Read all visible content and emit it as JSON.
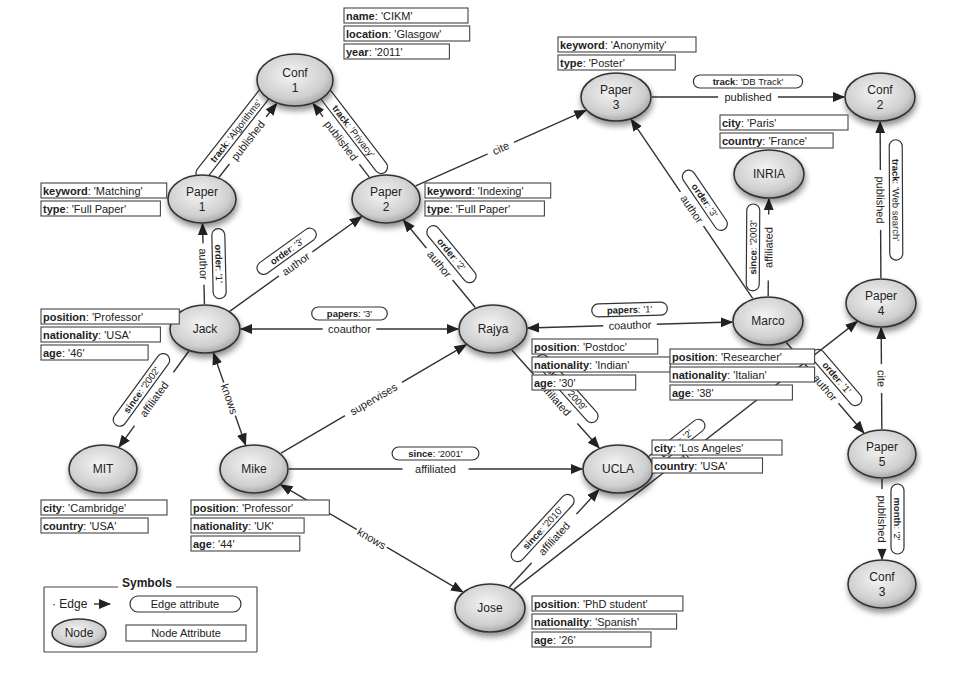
{
  "colors": {
    "node_fill_light": "#f2f2f2",
    "node_fill_dark": "#a8a8a8",
    "stroke": "#333333",
    "background": "#ffffff"
  },
  "nodes": [
    {
      "id": "conf1",
      "label": [
        "Conf",
        "1"
      ],
      "cx": 295,
      "cy": 80,
      "rx": 38,
      "ry": 26
    },
    {
      "id": "paper1",
      "label": [
        "Paper",
        "1"
      ],
      "cx": 202,
      "cy": 199,
      "rx": 34,
      "ry": 24
    },
    {
      "id": "paper2",
      "label": [
        "Paper",
        "2"
      ],
      "cx": 386,
      "cy": 199,
      "rx": 34,
      "ry": 24
    },
    {
      "id": "paper3",
      "label": [
        "Paper",
        "3"
      ],
      "cx": 616,
      "cy": 97,
      "rx": 35,
      "ry": 24
    },
    {
      "id": "conf2",
      "label": [
        "Conf",
        "2"
      ],
      "cx": 880,
      "cy": 97,
      "rx": 35,
      "ry": 24
    },
    {
      "id": "inria",
      "label": [
        "INRIA"
      ],
      "cx": 769,
      "cy": 174,
      "rx": 35,
      "ry": 24
    },
    {
      "id": "jack",
      "label": [
        "Jack"
      ],
      "cx": 205,
      "cy": 329,
      "rx": 35,
      "ry": 24
    },
    {
      "id": "rajya",
      "label": [
        "Rajya"
      ],
      "cx": 493,
      "cy": 329,
      "rx": 34,
      "ry": 24
    },
    {
      "id": "marco",
      "label": [
        "Marco"
      ],
      "cx": 768,
      "cy": 321,
      "rx": 35,
      "ry": 24
    },
    {
      "id": "paper4",
      "label": [
        "Paper",
        "4"
      ],
      "cx": 881,
      "cy": 303,
      "rx": 35,
      "ry": 24
    },
    {
      "id": "mit",
      "label": [
        "MIT"
      ],
      "cx": 103,
      "cy": 469,
      "rx": 34,
      "ry": 24
    },
    {
      "id": "mike",
      "label": [
        "Mike"
      ],
      "cx": 254,
      "cy": 469,
      "rx": 34,
      "ry": 24
    },
    {
      "id": "ucla",
      "label": [
        "UCLA"
      ],
      "cx": 618,
      "cy": 469,
      "rx": 35,
      "ry": 24
    },
    {
      "id": "paper5",
      "label": [
        "Paper",
        "5"
      ],
      "cx": 882,
      "cy": 454,
      "rx": 34,
      "ry": 24
    },
    {
      "id": "conf3",
      "label": [
        "Conf",
        "3"
      ],
      "cx": 882,
      "cy": 584,
      "rx": 34,
      "ry": 24
    },
    {
      "id": "jose",
      "label": [
        "Jose"
      ],
      "cx": 490,
      "cy": 608,
      "rx": 35,
      "ry": 24
    }
  ],
  "edges": [
    {
      "id": "e-p1-c1",
      "from": "paper1",
      "to": "conf1",
      "label": "published",
      "attr": "track: 'Algorithms'",
      "arrow": "end"
    },
    {
      "id": "e-p2-c1",
      "from": "paper2",
      "to": "conf1",
      "label": "published",
      "attr": "track: 'Privacy'",
      "arrow": "end"
    },
    {
      "id": "e-p2-p3",
      "from": "paper2",
      "to": "paper3",
      "label": "cite",
      "attr": null,
      "arrow": "end"
    },
    {
      "id": "e-p3-c2",
      "from": "paper3",
      "to": "conf2",
      "label": "published",
      "attr": "track: 'DB Track'",
      "arrow": "end"
    },
    {
      "id": "e-p4-c2",
      "from": "paper4",
      "to": "conf2",
      "label": "published",
      "attr": "track: 'Web search'",
      "arrow": "end"
    },
    {
      "id": "e-jack-p1",
      "from": "jack",
      "to": "paper1",
      "label": "author",
      "attr": "order: '1'",
      "arrow": "end"
    },
    {
      "id": "e-jack-p2",
      "from": "jack",
      "to": "paper2",
      "label": "author",
      "attr": "order: '3'",
      "arrow": "end"
    },
    {
      "id": "e-rajya-p2",
      "from": "rajya",
      "to": "paper2",
      "label": "author",
      "attr": "order: '2'",
      "arrow": "end"
    },
    {
      "id": "e-marco-p3",
      "from": "marco",
      "to": "paper3",
      "label": "author",
      "attr": "order: '3'",
      "arrow": "end"
    },
    {
      "id": "e-marco-inria",
      "from": "marco",
      "to": "inria",
      "label": "affiliated",
      "attr": "since: '2003'",
      "arrow": "end"
    },
    {
      "id": "e-jack-rajya",
      "from": "jack",
      "to": "rajya",
      "label": "coauthor",
      "attr": "papers: '3'",
      "arrow": "both"
    },
    {
      "id": "e-rajya-marco",
      "from": "rajya",
      "to": "marco",
      "label": "coauthor",
      "attr": "papers: '1'",
      "arrow": "both"
    },
    {
      "id": "e-marco-p5",
      "from": "marco",
      "to": "paper5",
      "label": "author",
      "attr": "order: '1'",
      "arrow": "end"
    },
    {
      "id": "e-jack-mit",
      "from": "jack",
      "to": "mit",
      "label": "affiliated",
      "attr": "since: '2002'",
      "arrow": "end"
    },
    {
      "id": "e-jack-mike",
      "from": "jack",
      "to": "mike",
      "label": "knows",
      "attr": null,
      "arrow": "both"
    },
    {
      "id": "e-mike-rajya",
      "from": "mike",
      "to": "rajya",
      "label": "supervises",
      "attr": null,
      "arrow": "end"
    },
    {
      "id": "e-rajya-ucla",
      "from": "rajya",
      "to": "ucla",
      "label": "affiliated",
      "attr": "since: '2009'",
      "arrow": "end"
    },
    {
      "id": "e-mike-ucla",
      "from": "mike",
      "to": "ucla",
      "label": "affiliated",
      "attr": "since: '2001'",
      "arrow": "end"
    },
    {
      "id": "e-mike-jose",
      "from": "mike",
      "to": "jose",
      "label": "knows",
      "attr": null,
      "arrow": "both"
    },
    {
      "id": "e-jose-ucla",
      "from": "jose",
      "to": "ucla",
      "label": "affiliated",
      "attr": "since: '2010'",
      "arrow": "end"
    },
    {
      "id": "e-jose-p4",
      "from": "jose",
      "to": "paper4",
      "label": "author",
      "attr": "order: '2'",
      "arrow": "end"
    },
    {
      "id": "e-p5-p4",
      "from": "paper5",
      "to": "paper4",
      "label": "cite",
      "attr": null,
      "arrow": "end"
    },
    {
      "id": "e-p5-c3",
      "from": "paper5",
      "to": "conf3",
      "label": "published",
      "attr": "month: '2'",
      "arrow": "end"
    }
  ],
  "node_attributes": [
    {
      "node": "conf1",
      "x": 344,
      "y": 8,
      "w": 124,
      "rows": [
        [
          "name",
          "'CIKM'"
        ],
        [
          "location",
          "'Glasgow'"
        ],
        [
          "year",
          "'2011'"
        ]
      ]
    },
    {
      "node": "paper1",
      "x": 41,
      "y": 183,
      "w": 124,
      "rows": [
        [
          "keyword",
          "'Matching'"
        ],
        [
          "type",
          "'Full Paper'"
        ]
      ]
    },
    {
      "node": "paper2",
      "x": 425,
      "y": 183,
      "w": 124,
      "rows": [
        [
          "keyword",
          "'Indexing'"
        ],
        [
          "type",
          "'Full Paper'"
        ]
      ]
    },
    {
      "node": "paper3",
      "x": 558,
      "y": 37,
      "w": 138,
      "rows": [
        [
          "keyword",
          "'Anonymity'"
        ],
        [
          "type",
          "'Poster'"
        ]
      ]
    },
    {
      "node": "inria",
      "x": 720,
      "y": 115,
      "w": 128,
      "rows": [
        [
          "city",
          "'Paris'"
        ],
        [
          "country",
          "'France'"
        ]
      ]
    },
    {
      "node": "jack",
      "x": 41,
      "y": 309,
      "w": 126,
      "rows": [
        [
          "position",
          "'Professor'"
        ],
        [
          "nationality",
          "'USA'"
        ],
        [
          "age",
          "'46'"
        ]
      ]
    },
    {
      "node": "rajya",
      "x": 532,
      "y": 339,
      "w": 122,
      "rows": [
        [
          "position",
          "'Postdoc'"
        ],
        [
          "nationality",
          "'Indian'"
        ],
        [
          "age",
          "'30'"
        ]
      ]
    },
    {
      "node": "marco",
      "x": 670,
      "y": 349,
      "w": 144,
      "rows": [
        [
          "position",
          "'Researcher'"
        ],
        [
          "nationality",
          "'Italian'"
        ],
        [
          "age",
          "'38'"
        ]
      ]
    },
    {
      "node": "mit",
      "x": 41,
      "y": 500,
      "w": 126,
      "rows": [
        [
          "city",
          "'Cambridge'"
        ],
        [
          "country",
          "'USA'"
        ]
      ]
    },
    {
      "node": "mike",
      "x": 191,
      "y": 500,
      "w": 128,
      "rows": [
        [
          "position",
          "'Professor'"
        ],
        [
          "nationality",
          "'UK'"
        ],
        [
          "age",
          "'44'"
        ]
      ]
    },
    {
      "node": "ucla",
      "x": 652,
      "y": 440,
      "w": 130,
      "rows": [
        [
          "city",
          "'Los Angeles'"
        ],
        [
          "country",
          "'USA'"
        ]
      ]
    },
    {
      "node": "jose",
      "x": 532,
      "y": 596,
      "w": 140,
      "rows": [
        [
          "position",
          "'PhD student'"
        ],
        [
          "nationality",
          "'Spanish'"
        ],
        [
          "age",
          "'26'"
        ]
      ]
    }
  ],
  "legend": {
    "title": "Symbols",
    "edge_label": "Edge",
    "edge_attribute_label": "Edge attribute",
    "node_label": "Node",
    "node_attribute_label": "Node Attribute"
  }
}
